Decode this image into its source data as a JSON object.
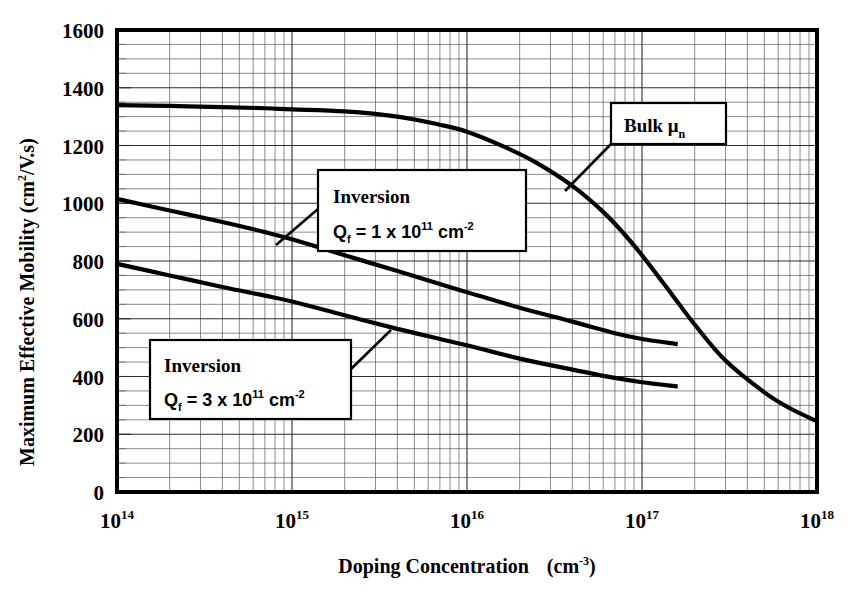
{
  "chart_data": {
    "type": "line",
    "title": "",
    "xlabel": "Doping Concentration   (cm-3)",
    "xlabel_main": "Doping Concentration",
    "xlabel_unit_base": "(cm",
    "xlabel_unit_sup": "-3",
    "xlabel_unit_close": ")",
    "ylabel_main": "Maximum Effective Mobility (cm",
    "ylabel_sup": "2",
    "ylabel_tail": "/V.s)",
    "ylabel": "Maximum Effective Mobility (cm2/V.s)",
    "xscale": "log",
    "yscale": "linear",
    "xlim": [
      100000000000000.0,
      1e+18
    ],
    "ylim": [
      0,
      1600
    ],
    "ytick_step": 200,
    "yticks": [
      0,
      200,
      400,
      600,
      800,
      1000,
      1200,
      1400,
      1600
    ],
    "ytick_labels": [
      "0",
      "200",
      "400",
      "600",
      "800",
      "1000",
      "1200",
      "1400",
      "1600"
    ],
    "y_minor_step": 50,
    "xticks": [
      100000000000000.0,
      1000000000000000.0,
      1e+16,
      1e+17,
      1e+18
    ],
    "xtick_labels": [
      {
        "base": "10",
        "exp": "14"
      },
      {
        "base": "10",
        "exp": "15"
      },
      {
        "base": "10",
        "exp": "16"
      },
      {
        "base": "10",
        "exp": "17"
      },
      {
        "base": "10",
        "exp": "18"
      }
    ],
    "grid": true,
    "grid_minor": true,
    "legend": "none",
    "series": [
      {
        "name": "Bulk mu_n",
        "label": "Bulk μ",
        "label_sub": "n",
        "points": [
          [
            100000000000000.0,
            1340
          ],
          [
            200000000000000.0,
            1337
          ],
          [
            400000000000000.0,
            1333
          ],
          [
            700000000000000.0,
            1329
          ],
          [
            1000000000000000.0,
            1325
          ],
          [
            2000000000000000.0,
            1318
          ],
          [
            4000000000000000.0,
            1300
          ],
          [
            7000000000000000.0,
            1272
          ],
          [
            1e+16,
            1248
          ],
          [
            1.6e+16,
            1198
          ],
          [
            2.5e+16,
            1140
          ],
          [
            4e+16,
            1060
          ],
          [
            6e+16,
            970
          ],
          [
            8e+16,
            890
          ],
          [
            1e+17,
            820
          ],
          [
            1.5e+17,
            680
          ],
          [
            2e+17,
            580
          ],
          [
            3e+17,
            455
          ],
          [
            5e+17,
            345
          ],
          [
            7e+17,
            290
          ],
          [
            1e+18,
            245
          ]
        ]
      },
      {
        "name": "Inversion Qf = 1 x 10^11 cm-2",
        "label_line1": "Inversion",
        "label_line2_q": "Q",
        "label_line2_q_sub": "f",
        "label_line2_eq": " = 1 x 10",
        "label_line2_sup": "11",
        "label_line2_unit": " cm",
        "label_line2_unit_sup": "-2",
        "points": [
          [
            100000000000000.0,
            1015
          ],
          [
            200000000000000.0,
            975
          ],
          [
            400000000000000.0,
            935
          ],
          [
            700000000000000.0,
            900
          ],
          [
            1000000000000000.0,
            875
          ],
          [
            2000000000000000.0,
            820
          ],
          [
            4000000000000000.0,
            765
          ],
          [
            7000000000000000.0,
            720
          ],
          [
            1e+16,
            692
          ],
          [
            2e+16,
            638
          ],
          [
            4e+16,
            590
          ],
          [
            7e+16,
            550
          ],
          [
            1e+17,
            530
          ],
          [
            1.6e+17,
            512
          ]
        ]
      },
      {
        "name": "Inversion Qf = 3 x 10^11 cm-2",
        "label_line1": "Inversion",
        "label_line2_q": "Q",
        "label_line2_q_sub": "f",
        "label_line2_eq": " = 3 x 10",
        "label_line2_sup": "11",
        "label_line2_unit": " cm",
        "label_line2_unit_sup": "-2",
        "points": [
          [
            100000000000000.0,
            790
          ],
          [
            200000000000000.0,
            750
          ],
          [
            400000000000000.0,
            710
          ],
          [
            700000000000000.0,
            680
          ],
          [
            1000000000000000.0,
            660
          ],
          [
            2000000000000000.0,
            612
          ],
          [
            4000000000000000.0,
            565
          ],
          [
            7000000000000000.0,
            530
          ],
          [
            1e+16,
            508
          ],
          [
            2e+16,
            462
          ],
          [
            4e+16,
            424
          ],
          [
            7e+16,
            395
          ],
          [
            1e+17,
            380
          ],
          [
            1.6e+17,
            365
          ]
        ]
      }
    ],
    "annotations": [
      {
        "id": "bulk-callout",
        "text": "Bulk μn",
        "anchor_x": 3.3e+16,
        "anchor_y": 1090
      },
      {
        "id": "inversion-1-callout",
        "text": "Inversion Qf = 1 x 10^11 cm-2",
        "anchor_x": 800000000000000.0,
        "anchor_y": 880
      },
      {
        "id": "inversion-3-callout",
        "text": "Inversion Qf = 3 x 10^11 cm-2",
        "anchor_x": 2200000000000000.0,
        "anchor_y": 605
      }
    ]
  },
  "colors": {
    "curve": "#000000",
    "frame": "#000000",
    "grid_minor": "#5a5a5a",
    "grid_major": "#2c2c2c",
    "background": "#ffffff",
    "callout_fill": "#ffffff"
  }
}
